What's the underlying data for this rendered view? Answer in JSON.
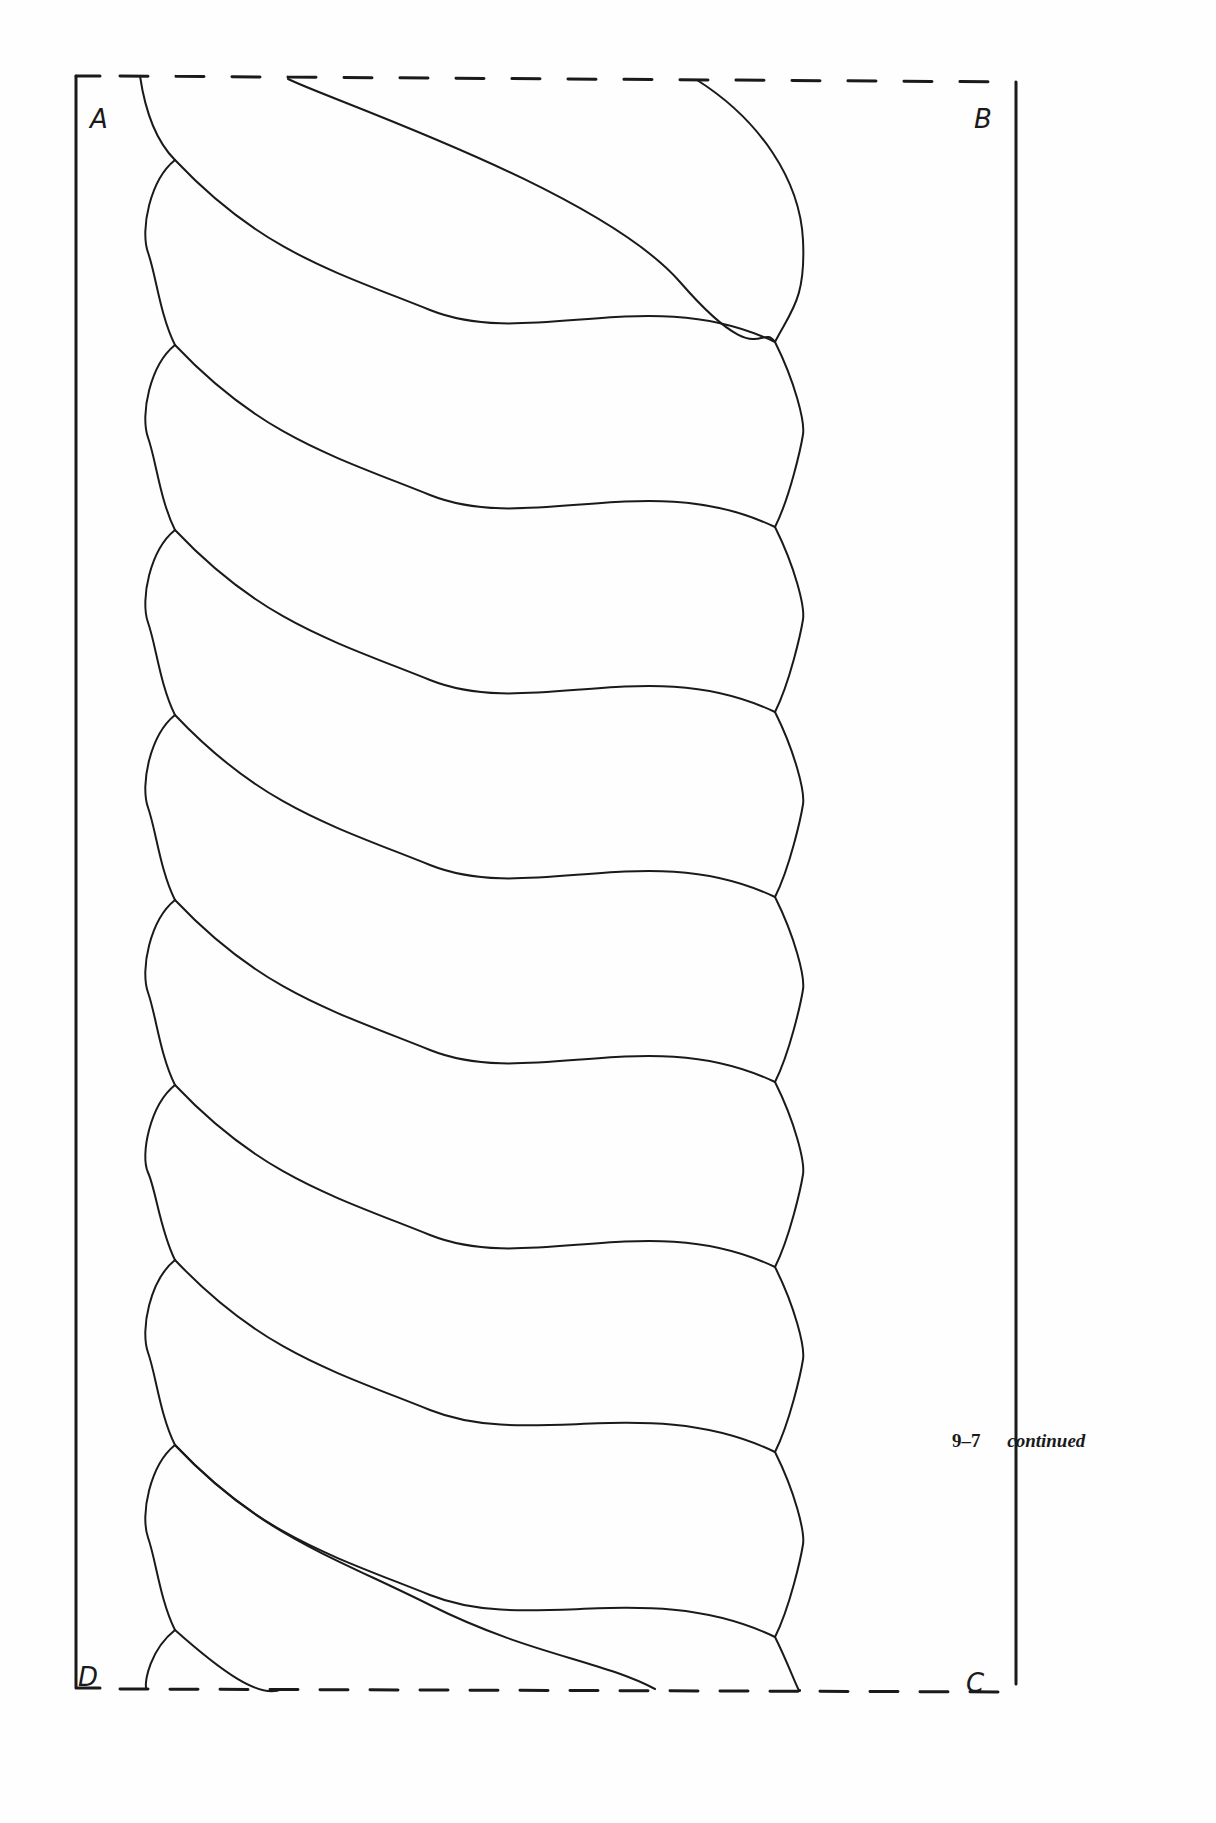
{
  "figure": {
    "number": "9–7",
    "caption_word": "continued",
    "corners": {
      "top_left": "A",
      "top_right": "B",
      "bottom_right": "C",
      "bottom_left": "D"
    },
    "pattern": "twisted-rope quilting border template",
    "strand_count": 9,
    "colors": {
      "ink": "#1a1a1a",
      "paper": "#fefefe"
    }
  }
}
